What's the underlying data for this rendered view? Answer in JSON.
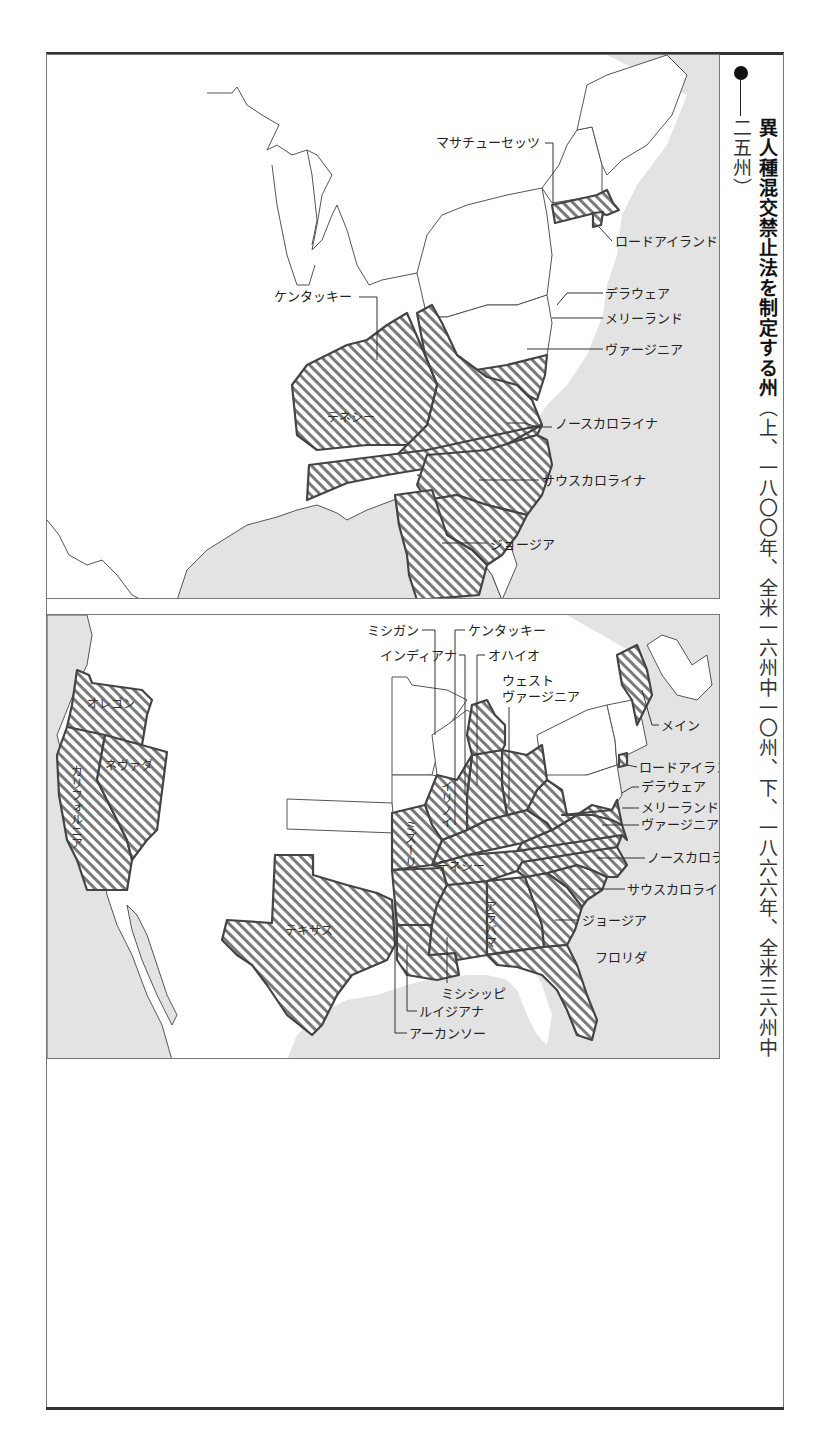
{
  "caption": {
    "bullet_icon": "filled-circle",
    "title": "異人種混交禁止法を制定する州",
    "subtitle": "（上、一八〇〇年、全米一六州中一〇州、下、一八六六年、全米三六州中二五州）"
  },
  "colors": {
    "sea": "#e3e3e3",
    "land": "#ffffff",
    "hatch_line": "#7a7a7a",
    "state_border": "#444444",
    "frame_rule": "#333333"
  },
  "map_top": {
    "year": "1800",
    "states_total": 16,
    "states_with_law": 10,
    "labels": {
      "massachusetts": "マサチューセッツ",
      "rhode_island": "ロードアイランド",
      "delaware": "デラウェア",
      "maryland": "メリーランド",
      "virginia": "ヴァージニア",
      "kentucky": "ケンタッキー",
      "tennessee": "テネシー",
      "north_carolina": "ノースカロライナ",
      "south_carolina": "サウスカロライナ",
      "georgia": "ジョージア"
    }
  },
  "map_bottom": {
    "year": "1866",
    "states_total": 36,
    "states_with_law": 25,
    "labels": {
      "michigan": "ミシガン",
      "kentucky": "ケンタッキー",
      "indiana": "インディアナ",
      "ohio": "オハイオ",
      "west_virginia_1": "ウェスト",
      "west_virginia_2": "ヴァージニア",
      "maine": "メイン",
      "rhode_island": "ロードアイランド",
      "delaware": "デラウェア",
      "maryland": "メリーランド",
      "virginia": "ヴァージニア",
      "north_carolina": "ノースカロライナ",
      "south_carolina": "サウスカロライナ",
      "georgia": "ジョージア",
      "florida": "フロリダ",
      "mississippi": "ミシシッピ",
      "louisiana": "ルイジアナ",
      "arkansas": "アーカンソー",
      "oregon": "オレゴン",
      "california": "カリフォルニア",
      "nevada": "ネヴァダ",
      "texas": "テキサス",
      "tennessee": "テネシー",
      "alabama": "アラバマ",
      "missouri": "ミズーリ",
      "illinois": "イリノイ"
    }
  }
}
